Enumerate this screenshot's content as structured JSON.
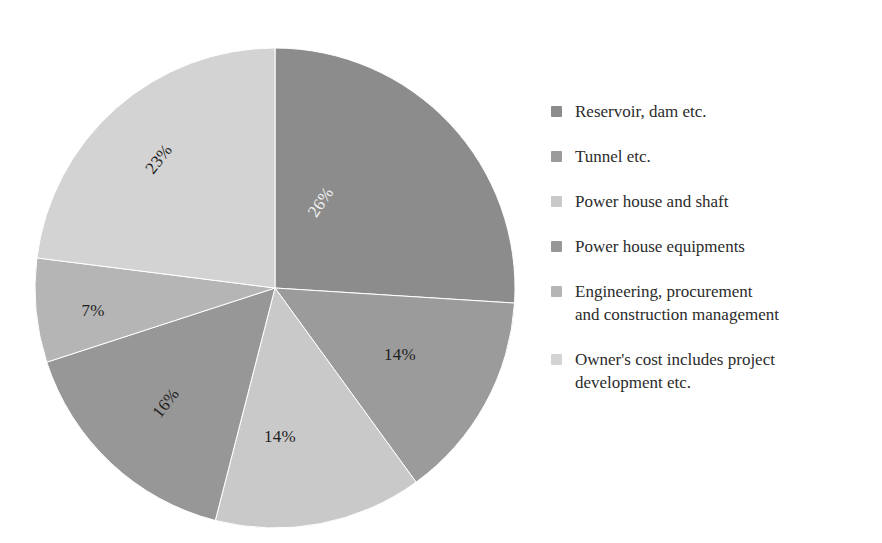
{
  "chart_data": {
    "type": "pie",
    "title": "",
    "categories": [
      "Reservoir, dam etc.",
      "Tunnel etc.",
      "Power house and shaft",
      "Power house equipments",
      "Engineering, procurement and construction management",
      "Owner's cost includes project development etc."
    ],
    "values": [
      26,
      14,
      14,
      16,
      7,
      23
    ],
    "value_unit": "%",
    "data_labels": [
      "26%",
      "14%",
      "14%",
      "16%",
      "7%",
      "23%"
    ],
    "colors": [
      "#8c8c8c",
      "#9b9b9b",
      "#c9c9c9",
      "#979797",
      "#b5b5b5",
      "#d3d3d3"
    ],
    "start_angle_deg": 0,
    "direction": "clockwise",
    "legend_position": "right",
    "grid": false,
    "xlabel": "",
    "ylabel": ""
  },
  "pie": {
    "center_x": 275,
    "center_y": 288,
    "radius": 240,
    "slices": [
      {
        "name": "Reservoir, dam etc.",
        "percent": 26,
        "label": "26%",
        "color": "#8c8c8c",
        "label_color": "#f2f2f2",
        "label_x": 322,
        "label_y": 203,
        "label_rotation": -56
      },
      {
        "name": "Tunnel etc.",
        "percent": 14,
        "label": "14%",
        "color": "#9b9b9b",
        "label_color": "#1f1f1f",
        "label_x": 400,
        "label_y": 356,
        "label_rotation": 0
      },
      {
        "name": "Power house and shaft",
        "percent": 14,
        "label": "14%",
        "color": "#c9c9c9",
        "label_color": "#1f1f1f",
        "label_x": 280,
        "label_y": 438,
        "label_rotation": 0
      },
      {
        "name": "Power house equipments",
        "percent": 16,
        "label": "16%",
        "color": "#979797",
        "label_color": "#1f1f1f",
        "label_x": 167,
        "label_y": 404,
        "label_rotation": -52
      },
      {
        "name": "Engineering, procurement and construction management",
        "percent": 7,
        "label": "7%",
        "color": "#b5b5b5",
        "label_color": "#1f1f1f",
        "label_x": 93,
        "label_y": 312,
        "label_rotation": 0
      },
      {
        "name": "Owner's cost includes project development etc.",
        "percent": 23,
        "label": "23%",
        "color": "#d3d3d3",
        "label_color": "#1f1f1f",
        "label_x": 160,
        "label_y": 160,
        "label_rotation": -52
      }
    ]
  },
  "legend": {
    "items": [
      {
        "label": "Reservoir, dam etc.",
        "color": "#8c8c8c"
      },
      {
        "label": "Tunnel etc.",
        "color": "#9b9b9b"
      },
      {
        "label": "Power house and shaft",
        "color": "#c9c9c9"
      },
      {
        "label": "Power house equipments",
        "color": "#979797"
      },
      {
        "label": "Engineering, procurement\nand construction management",
        "color": "#b5b5b5"
      },
      {
        "label": "Owner's cost includes project\ndevelopment etc.",
        "color": "#d3d3d3"
      }
    ]
  }
}
